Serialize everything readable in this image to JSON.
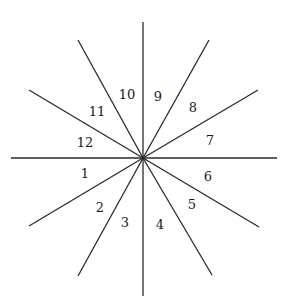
{
  "diagram": {
    "type": "radial-sectors",
    "center": {
      "x": 143,
      "y": 158
    },
    "line_color": "#2a2a2a",
    "rays": [
      {
        "id": "vertical-up",
        "x": 143,
        "y": 22
      },
      {
        "id": "vertical-down",
        "x": 143,
        "y": 296
      },
      {
        "id": "horizontal-left",
        "x": 11,
        "y": 158
      },
      {
        "id": "horizontal-right",
        "x": 277,
        "y": 158
      },
      {
        "id": "upper-left-shallow",
        "x": 29,
        "y": 90
      },
      {
        "id": "upper-left-steep",
        "x": 78,
        "y": 40
      },
      {
        "id": "upper-right-steep",
        "x": 209,
        "y": 40
      },
      {
        "id": "upper-right-shallow",
        "x": 258,
        "y": 90
      },
      {
        "id": "lower-left-shallow",
        "x": 29,
        "y": 226
      },
      {
        "id": "lower-left-steep",
        "x": 78,
        "y": 276
      },
      {
        "id": "lower-right-shallow",
        "x": 259,
        "y": 227
      },
      {
        "id": "lower-right-steep",
        "x": 212,
        "y": 275
      }
    ],
    "sector_labels": [
      {
        "text": "1",
        "x": 85,
        "y": 174
      },
      {
        "text": "2",
        "x": 100,
        "y": 208
      },
      {
        "text": "3",
        "x": 125,
        "y": 223
      },
      {
        "text": "4",
        "x": 160,
        "y": 225
      },
      {
        "text": "5",
        "x": 192,
        "y": 205
      },
      {
        "text": "6",
        "x": 208,
        "y": 177
      },
      {
        "text": "7",
        "x": 210,
        "y": 141
      },
      {
        "text": "8",
        "x": 193,
        "y": 108
      },
      {
        "text": "9",
        "x": 158,
        "y": 97
      },
      {
        "text": "10",
        "x": 127,
        "y": 95
      },
      {
        "text": "11",
        "x": 97,
        "y": 112
      },
      {
        "text": "12",
        "x": 85,
        "y": 143
      }
    ]
  }
}
